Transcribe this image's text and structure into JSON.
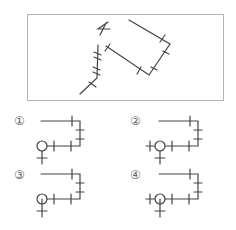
{
  "question": {
    "figure_name": "Map-like drawing with tick marks (scrambled orientation)"
  },
  "options": [
    {
      "label": "①",
      "variant": "circle-left-no-left-stub-stem-outside"
    },
    {
      "label": "②",
      "variant": "circle-with-left-stub-stem-outside"
    },
    {
      "label": "③",
      "variant": "circle-left-no-left-stub-stem-inside"
    },
    {
      "label": "④",
      "variant": "circle-with-left-stub-stem-inside"
    }
  ],
  "colors": {
    "stroke": "#444444",
    "frame": "#b5b5b5",
    "label": "#666666"
  }
}
